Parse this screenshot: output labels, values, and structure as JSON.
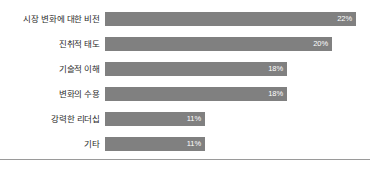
{
  "chart_data": {
    "type": "bar",
    "orientation": "horizontal",
    "title": "",
    "xlabel": "",
    "ylabel": "",
    "grid": false,
    "legend": false,
    "axis_visible": false,
    "value_suffix": "%",
    "xlim": [
      0,
      22
    ],
    "categories": [
      "시장 변화에 대한 비전",
      "진취적 태도",
      "기술적 이해",
      "변화의 수용",
      "강력한 리더십",
      "기타"
    ],
    "values": [
      22,
      20,
      18,
      18,
      11,
      11
    ],
    "value_labels": [
      "22%",
      "20%",
      "18%",
      "18%",
      "11%",
      "11%"
    ],
    "bars": [
      {
        "label": "시장 변화에 대한 비전",
        "value": 22,
        "value_label": "22%",
        "pixel_width": 251
      },
      {
        "label": "진취적 태도",
        "value": 20,
        "value_label": "20%",
        "pixel_width": 227
      },
      {
        "label": "기술적 이해",
        "value": 18,
        "value_label": "18%",
        "pixel_width": 182
      },
      {
        "label": "변화의 수용",
        "value": 18,
        "value_label": "18%",
        "pixel_width": 182
      },
      {
        "label": "강력한 리더십",
        "value": 11,
        "value_label": "11%",
        "pixel_width": 100
      },
      {
        "label": "기타",
        "value": 11,
        "value_label": "11%",
        "pixel_width": 100
      }
    ]
  },
  "colors": {
    "bar_fill": "#808080",
    "value_text": "#ffffff",
    "category_text": "#2b2b2b",
    "background": "#ffffff",
    "rule": "#9a9a9a"
  }
}
